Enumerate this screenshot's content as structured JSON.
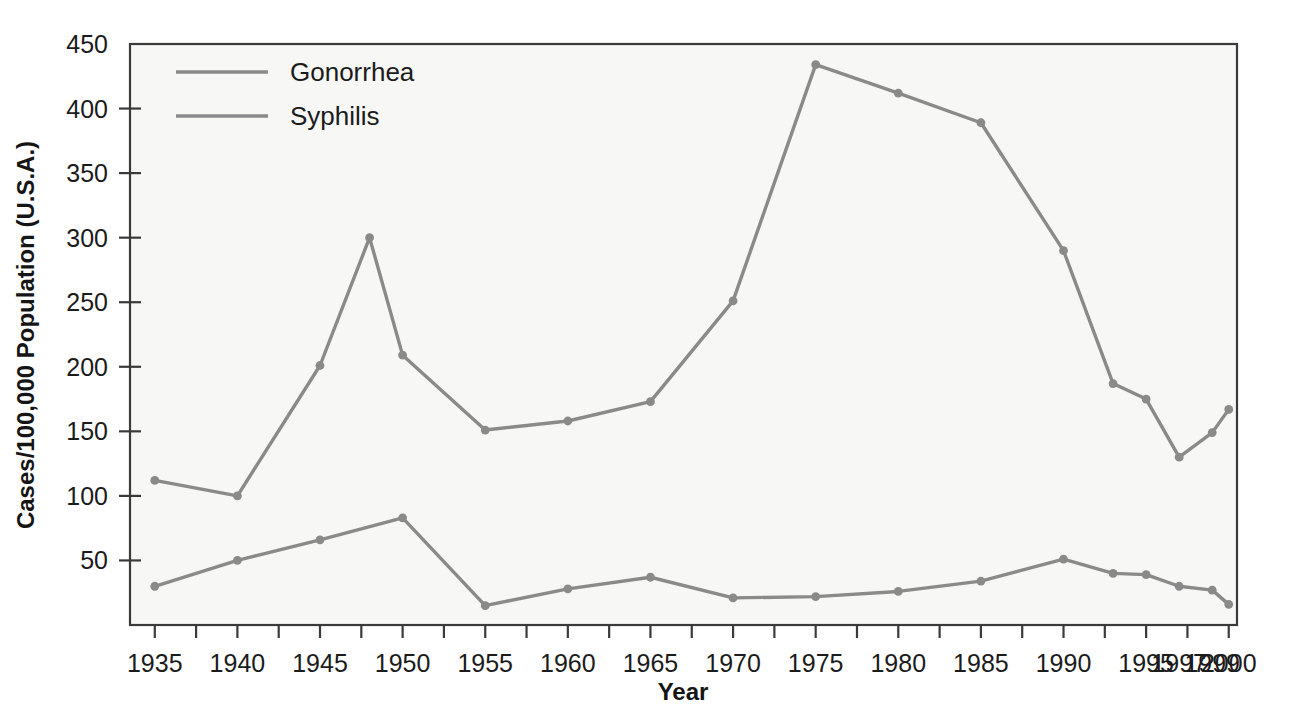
{
  "chart_data": {
    "type": "line",
    "title": "",
    "xlabel": "Year",
    "ylabel": "Cases/100,000 Population (U.S.A.)",
    "x": [
      1935,
      1940,
      1945,
      1948,
      1950,
      1955,
      1960,
      1965,
      1970,
      1975,
      1980,
      1985,
      1990,
      1993,
      1995,
      1997,
      1999,
      2000
    ],
    "xtick_labels": [
      "1935",
      "1940",
      "1945",
      "1950",
      "1955",
      "1960",
      "1965",
      "1970",
      "1975",
      "1980",
      "1985",
      "1990",
      "1995",
      "1997",
      "1999",
      "2000"
    ],
    "xtick_values": [
      1935,
      1940,
      1945,
      1950,
      1955,
      1960,
      1965,
      1970,
      1975,
      1980,
      1985,
      1990,
      1995,
      1997,
      1999,
      2000
    ],
    "xlim": [
      1933.5,
      2000.5
    ],
    "ytick_labels": [
      "50",
      "100",
      "150",
      "200",
      "250",
      "300",
      "350",
      "400",
      "450"
    ],
    "ytick_values": [
      50,
      100,
      150,
      200,
      250,
      300,
      350,
      400,
      450
    ],
    "ylim": [
      0,
      450
    ],
    "grid": false,
    "legend_position": "top-left",
    "series": [
      {
        "name": "Gonorrhea",
        "color": "#8a8a8a",
        "x": [
          1935,
          1940,
          1945,
          1948,
          1950,
          1955,
          1960,
          1965,
          1970,
          1975,
          1980,
          1985,
          1990,
          1993,
          1995,
          1997,
          1999,
          2000
        ],
        "values": [
          112,
          100,
          201,
          300,
          209,
          151,
          158,
          173,
          251,
          434,
          412,
          389,
          290,
          187,
          175,
          130,
          149,
          167
        ]
      },
      {
        "name": "Syphilis",
        "color": "#8a8a8a",
        "x": [
          1935,
          1940,
          1945,
          1950,
          1955,
          1960,
          1965,
          1970,
          1975,
          1980,
          1985,
          1990,
          1993,
          1995,
          1997,
          1999,
          2000
        ],
        "values": [
          30,
          50,
          66,
          83,
          15,
          28,
          37,
          21,
          22,
          26,
          34,
          51,
          40,
          39,
          30,
          27,
          16
        ]
      }
    ],
    "legend_entries": [
      {
        "label": "Gonorrhea",
        "color": "#8a8a8a"
      },
      {
        "label": "Syphilis",
        "color": "#8a8a8a"
      }
    ]
  },
  "style": {
    "plot_background": "#f7f7f5",
    "axis_color": "#3a3a3a",
    "page_background": "#ffffff",
    "line_color": "#8a8a8a",
    "marker_color": "#8a8a8a"
  },
  "geometry": {
    "plot_left": 130,
    "plot_right": 1237,
    "plot_top": 44,
    "plot_bottom": 625,
    "minor_tick_step": 2.5
  }
}
